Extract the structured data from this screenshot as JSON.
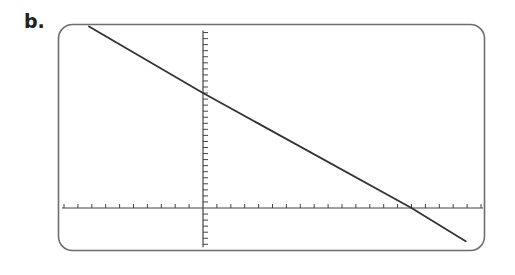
{
  "label": "b.",
  "colors": {
    "frame": "#6e6e6e",
    "axis": "#444444",
    "line": "#333333",
    "background": "#ffffff"
  },
  "chart_data": {
    "type": "line",
    "title": "",
    "xlabel": "",
    "ylabel": "",
    "grid": false,
    "legend": null,
    "xlim": [
      -10,
      20
    ],
    "ylim": [
      -6,
      29
    ],
    "xtick_step": 1,
    "ytick_step": 1,
    "tick_labels_shown": false,
    "series": [
      {
        "name": "line",
        "x": [
          -8.2,
          0,
          15,
          18.9
        ],
        "y": [
          30,
          19,
          0,
          -5.5
        ]
      }
    ],
    "annotations": {
      "y_intercept": 19,
      "x_intercept": 15,
      "slope_approx": -1.27
    }
  }
}
